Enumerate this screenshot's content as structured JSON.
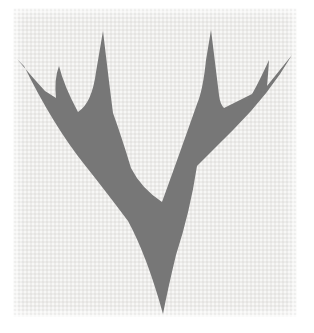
{
  "figure": {
    "viewbox": "0 0 314 333",
    "colors": {
      "page_background": "#ffffff",
      "paper": "#ebeae8",
      "ink": "#696969"
    },
    "silhouette_path": "M163 314 Q147 256 128 221 Q104 189 84 164 Q53 125 24 66 L17 59 Q33 78 45 91 L56 98 Q54 79 59 66 Q64 86 78 112 Q92 103 96 72 L103 31 Q109 82 113 113 Q122 138 131 168 Q141 188 162 202 Q178 158 197 104 Q203 90 206 60 L211 30 Q216 70 219 95 Q220 104 224 108 L252 94 Q258 84 269 60 Q268 76 267 86 Q275 76 292 55 Q270 93 234 129 Q214 149 197 166 Q190 212 176 255 Q168 288 163 314 Z"
  }
}
